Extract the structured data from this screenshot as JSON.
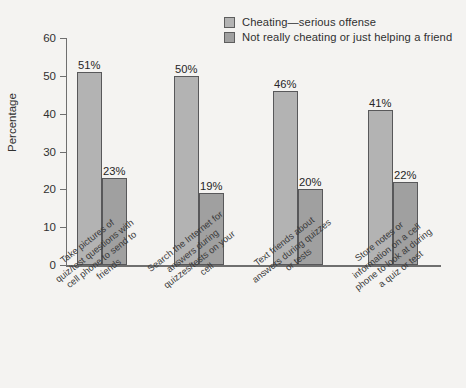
{
  "chart_data": {
    "type": "bar",
    "title": "",
    "subtitle": "",
    "xlabel": "",
    "ylabel": "Percentage",
    "ylim": [
      0,
      60
    ],
    "yticks": [
      0,
      10,
      20,
      30,
      40,
      50,
      60
    ],
    "grid": false,
    "legend_position": "top-right",
    "categories": [
      "Take pictures of\nquiz/test questions with\ncell phone to send to\nfriends",
      "Search the Internet for\nanswers during\nquizzes/tests on your\ncell",
      "Text friends about\nanswers during quizzes\nor tests",
      "Store notes or\ninformation on a cell\nphone to look at during\na quiz or test"
    ],
    "series": [
      {
        "name": "Cheating—serious offense",
        "color": "#b3b3b3",
        "values": [
          51,
          50,
          46,
          41
        ],
        "labels": [
          "51%",
          "50%",
          "46%",
          "41%"
        ]
      },
      {
        "name": "Not really cheating or just helping a friend",
        "color": "#a0a0a0",
        "values": [
          23,
          19,
          20,
          22
        ],
        "labels": [
          "23%",
          "19%",
          "20%",
          "22%"
        ]
      }
    ]
  },
  "axis": {
    "y_title": "Percentage",
    "y_tick_labels": [
      "60",
      "50",
      "40",
      "30",
      "20",
      "10",
      "0"
    ]
  },
  "legend": {
    "items": [
      {
        "label": "Cheating—serious offense"
      },
      {
        "label": "Not really cheating or just helping a friend"
      }
    ]
  }
}
